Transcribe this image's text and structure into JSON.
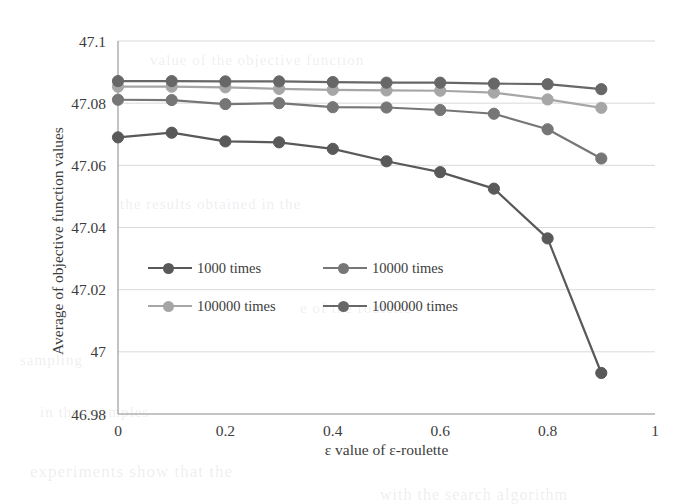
{
  "chart_data": {
    "type": "line",
    "title": "",
    "xlabel": "ε value of ε-roulette",
    "ylabel": "Average of objective function values",
    "x": [
      0,
      0.1,
      0.2,
      0.3,
      0.4,
      0.5,
      0.6,
      0.7,
      0.8,
      0.9
    ],
    "xlim": [
      0,
      1
    ],
    "ylim": [
      46.98,
      47.1
    ],
    "xticks": [
      "0",
      "0.2",
      "0.4",
      "0.6",
      "0.8",
      "1"
    ],
    "xtick_values": [
      0,
      0.2,
      0.4,
      0.6,
      0.8,
      1
    ],
    "yticks": [
      "46.98",
      "47",
      "47.02",
      "47.04",
      "47.06",
      "47.08",
      "47.1"
    ],
    "ytick_values": [
      46.98,
      47.0,
      47.02,
      47.04,
      47.06,
      47.08,
      47.1
    ],
    "grid": "horizontal",
    "legend_position": "inside-lower-left",
    "markers": "circle",
    "series": [
      {
        "name": "1000 times",
        "color": "#595959",
        "values": [
          47.069,
          47.0705,
          47.0677,
          47.0674,
          47.0653,
          47.0613,
          47.0578,
          47.0525,
          47.0365,
          46.9932
        ]
      },
      {
        "name": "10000 times",
        "color": "#767676",
        "values": [
          47.0811,
          47.081,
          47.0797,
          47.08,
          47.0787,
          47.0786,
          47.0778,
          47.0766,
          47.0716,
          47.0622
        ]
      },
      {
        "name": "100000 times",
        "color": "#A6A6A6",
        "values": [
          47.0853,
          47.0853,
          47.0851,
          47.0846,
          47.0843,
          47.0841,
          47.084,
          47.0834,
          47.0812,
          47.0785
        ]
      },
      {
        "name": "1000000 times",
        "color": "#676767",
        "values": [
          47.0871,
          47.0871,
          47.087,
          47.087,
          47.0868,
          47.0866,
          47.0866,
          47.0863,
          47.0861,
          47.0845
        ]
      }
    ]
  },
  "legend": {
    "items": [
      {
        "label": "1000 times",
        "color": "#595959"
      },
      {
        "label": "10000 times",
        "color": "#767676"
      },
      {
        "label": "100000 times",
        "color": "#A6A6A6"
      },
      {
        "label": "1000000 times",
        "color": "#676767"
      }
    ]
  },
  "axes": {
    "x_title": "ε value of ε-roulette",
    "y_title": "Average of objective function values"
  },
  "background_text": {
    "lines": [
      "value of the objective function",
      "the results obtained in the",
      "e of the roulette",
      "sampling",
      "in the examples",
      "experiments show that the",
      "with the search algorithm"
    ]
  }
}
